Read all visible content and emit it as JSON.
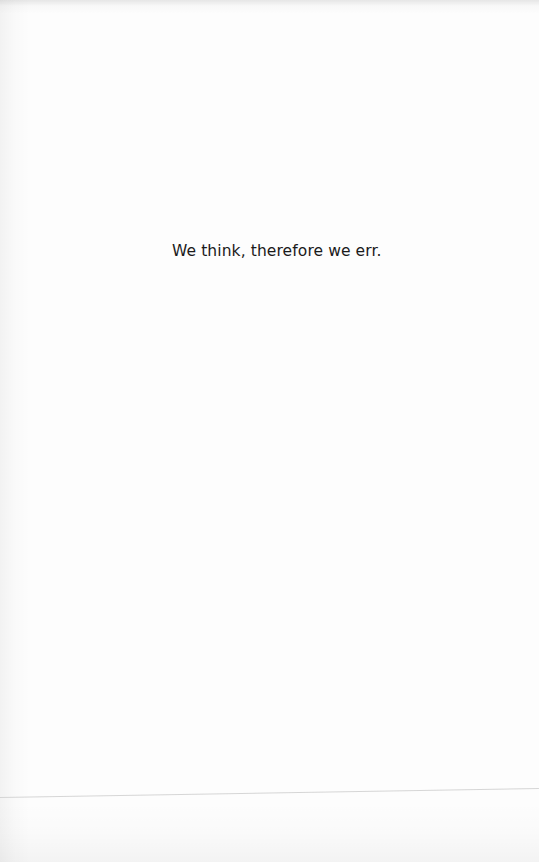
{
  "page": {
    "epigraph": "We think, therefore we err.",
    "colors": {
      "background": "#fdfdfd",
      "text": "#1a1a1a",
      "rule": "#cfcfcf"
    }
  }
}
